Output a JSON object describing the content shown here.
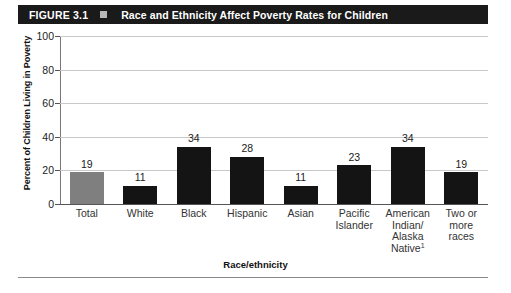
{
  "header": {
    "figure_number": "FIGURE 3.1",
    "marker_icon": "square-marker-icon",
    "title": "Race and Ethnicity Affect Poverty Rates for Children",
    "bar_color": "#1a1a1a",
    "text_color": "#ffffff",
    "marker_color": "#b8b8b8"
  },
  "colors": {
    "total_bar": "#7f7f7f",
    "group_bar": "#141414",
    "gridline": "#c8c8c8",
    "axis": "#555555"
  },
  "chart_data": {
    "type": "bar",
    "title": "Race and Ethnicity Affect Poverty Rates for Children",
    "xlabel": "Race/ethnicity",
    "ylabel": "Percent of Children Living in Poverty",
    "ylim": [
      0,
      100
    ],
    "yticks": [
      0,
      20,
      40,
      60,
      80,
      100
    ],
    "ytick_labels": [
      "0",
      "20",
      "40",
      "60",
      "80",
      "100"
    ],
    "grid": true,
    "legend": "none",
    "categories": [
      "Total",
      "White",
      "Black",
      "Hispanic",
      "Asian",
      "Pacific Islander",
      "American Indian/ Alaska Native",
      "Two or more races"
    ],
    "category_lines": [
      [
        "Total"
      ],
      [
        "White"
      ],
      [
        "Black"
      ],
      [
        "Hispanic"
      ],
      [
        "Asian"
      ],
      [
        "Pacific",
        "Islander"
      ],
      [
        "American",
        "Indian/",
        "Alaska",
        "Native"
      ],
      [
        "Two or",
        "more",
        "races"
      ]
    ],
    "values": [
      19,
      11,
      34,
      28,
      11,
      23,
      34,
      19
    ],
    "value_labels": [
      "19",
      "11",
      "34",
      "28",
      "11",
      "23",
      "34",
      "19"
    ],
    "bar_colors": [
      "#7f7f7f",
      "#141414",
      "#141414",
      "#141414",
      "#141414",
      "#141414",
      "#141414",
      "#141414"
    ],
    "footnote_marker": "1",
    "footnote_on_category_index": 6
  }
}
